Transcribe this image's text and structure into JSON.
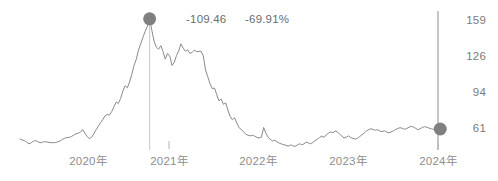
{
  "chart_data": {
    "type": "line",
    "title": "",
    "subtitle": "",
    "xlabel": "",
    "ylabel": "",
    "grid": false,
    "legend": "none",
    "ylim": [
      40,
      170
    ],
    "y_ticks": [
      "159",
      "126",
      "94",
      "61"
    ],
    "y_tick_values": [
      159,
      126,
      94,
      61
    ],
    "x_ticks": [
      "2020年",
      "2021年",
      "2022年",
      "2023年",
      "2024年"
    ],
    "annotations": [
      {
        "name": "peak-value",
        "text": "-109.46"
      },
      {
        "name": "peak-change",
        "text": "-69.91%"
      }
    ],
    "markers": [
      {
        "name": "peak-marker",
        "x_index": 58,
        "value": 161
      },
      {
        "name": "end-marker",
        "x_index": 188,
        "value": 61
      }
    ],
    "series": [
      {
        "name": "price",
        "color": "#8a8a8a",
        "values": [
          52,
          51,
          50.5,
          49,
          47.5,
          48.5,
          50,
          50.5,
          49.5,
          48.5,
          49,
          49.5,
          49.3,
          48.8,
          48.6,
          48.6,
          48.7,
          49.4,
          50.2,
          51.6,
          52.6,
          53.2,
          53.4,
          54.2,
          55.4,
          56.6,
          57.2,
          58.1,
          60.6,
          57.3,
          54.4,
          52.2,
          53.4,
          56.6,
          60.2,
          63.4,
          66.6,
          69.4,
          72.8,
          74.2,
          73.6,
          76.6,
          81.2,
          85.4,
          84.2,
          88.6,
          95.4,
          100.2,
          98.4,
          103.6,
          110.4,
          118.6,
          124.2,
          132.6,
          138.4,
          144.2,
          149.6,
          154.2,
          161,
          150.4,
          140.6,
          135.2,
          133.4,
          136.6,
          131.2,
          124.4,
          129.6,
          127.2,
          118.6,
          121.4,
          127.6,
          131.8,
          138.2,
          134.4,
          131.6,
          132.8,
          129.6,
          130.4,
          132.6,
          131.2,
          131.4,
          131.6,
          127.2,
          114.6,
          108.4,
          102.2,
          97.6,
          98.2,
          92.4,
          86.6,
          88.2,
          83.4,
          84.6,
          78.2,
          72.6,
          69.4,
          71.2,
          66.4,
          62.2,
          60.6,
          58.4,
          56.2,
          55.4,
          54.8,
          55.2,
          54.6,
          53.4,
          52.8,
          53.6,
          62.4,
          57.2,
          53.4,
          51.6,
          50.2,
          50.8,
          49.4,
          48.2,
          47.4,
          46.8,
          46.2,
          45.4,
          46.6,
          45.8,
          45.2,
          46.4,
          47.6,
          46.8,
          47.4,
          49.2,
          48.4,
          47.6,
          48.8,
          50.4,
          51.8,
          53.2,
          54.6,
          53.4,
          55.6,
          57.2,
          58.4,
          57.6,
          59.2,
          58.4,
          56.2,
          54.6,
          52.8,
          53.6,
          54.8,
          53.2,
          52.4,
          51.8,
          52.6,
          54.2,
          55.8,
          57.4,
          59.2,
          60.4,
          61.2,
          60.6,
          59.8,
          60.4,
          59.2,
          58.6,
          59.4,
          58.2,
          57.6,
          58.4,
          59.2,
          60.6,
          61.4,
          62.2,
          61.6,
          60.8,
          61.4,
          62.6,
          63.4,
          62.8,
          61.6,
          60.4,
          61.2,
          62.4,
          63.2,
          62.6,
          61.8,
          61.2,
          60.6,
          61.4,
          61
        ]
      }
    ]
  }
}
